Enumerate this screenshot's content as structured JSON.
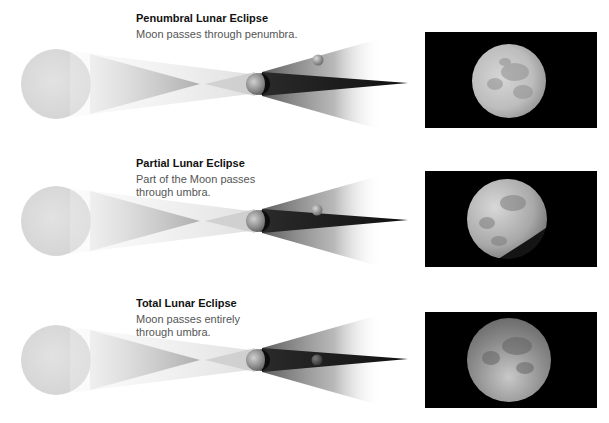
{
  "panels": [
    {
      "id": "penumbral",
      "title": "Penumbral Lunar Eclipse",
      "description_lines": [
        "Moon passes through penumbra."
      ],
      "moon_position": "penumbra",
      "photo_alt": "Penumbral eclipsed full Moon photo"
    },
    {
      "id": "partial",
      "title": "Partial Lunar Eclipse",
      "description_lines": [
        "Part of the Moon passes",
        "through umbra."
      ],
      "moon_position": "partial-umbra",
      "photo_alt": "Partially eclipsed Moon photo"
    },
    {
      "id": "total",
      "title": "Total Lunar Eclipse",
      "description_lines": [
        "Moon passes entirely",
        "through umbra."
      ],
      "moon_position": "umbra",
      "photo_alt": "Totally eclipsed Moon photo"
    }
  ],
  "colors": {
    "sun": "#dcdcdc",
    "penumbra": "#8a8a8a",
    "umbra": "#1a1a1a",
    "photo_background": "#000000",
    "moon_bright": "#e8e8e8",
    "moon_shadowed": "#6a6a6a"
  }
}
